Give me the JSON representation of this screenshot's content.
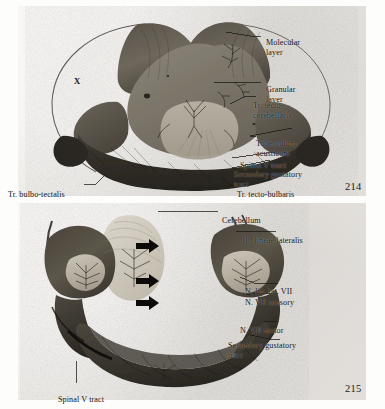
{
  "page": {
    "background_color": "#fdfdfc",
    "plate_background_color": "#eceae6",
    "ink_color": "#15130f"
  },
  "figures": [
    {
      "id": "figure-214",
      "page_number": "214",
      "description": "Transverse section through the cerebellum and auricular region",
      "interior_labels": [
        {
          "name": "region-marker-x",
          "text": "X",
          "x": 74,
          "y": 72
        }
      ],
      "callouts": [
        {
          "name": "callout-molecular-layer",
          "text": "Molecular\nlayer",
          "align": "left",
          "x": 266,
          "y": 29
        },
        {
          "name": "callout-granular-layer",
          "text": "Granular\nlayer",
          "align": "left",
          "x": 266,
          "y": 76
        },
        {
          "name": "callout-tr-tecto-cerebellaris",
          "text": "Tr. tecto-\ncerebellaris",
          "align": "left",
          "x": 253,
          "y": 92
        },
        {
          "name": "callout-tuberculum-acusticum",
          "text": "Tuberculum\nacusticum",
          "align": "left",
          "x": 256,
          "y": 130
        },
        {
          "name": "callout-spinal-v-tract",
          "text": "Spinal V tract",
          "align": "left",
          "x": 240,
          "y": 152
        },
        {
          "name": "callout-secondary-gustatory-tract",
          "text": "Secondary gustatory\ntract",
          "align": "left",
          "x": 234,
          "y": 161
        },
        {
          "name": "callout-tr-tecto-bulbaris",
          "text": "Tr. tecto-bulbaris",
          "align": "left",
          "x": 237,
          "y": 181
        },
        {
          "name": "callout-tr-bulbo-tectalis",
          "text": "Tr. bulbo-tectalis",
          "align": "left",
          "x": 8,
          "y": 181
        }
      ]
    },
    {
      "id": "figure-215",
      "page_number": "215",
      "description": "Dissection of the cerebellum, lateral line and facial nerve components",
      "interior_labels": [],
      "callouts": [
        {
          "name": "callout-cerebellum",
          "text": "Cerebellum",
          "align": "left",
          "x": 222,
          "y": 207
        },
        {
          "name": "callout-l-lineae-lateralis",
          "text": "L. lineae lateralis",
          "align": "left",
          "x": 245,
          "y": 229
        },
        {
          "name": "callout-n-lin-lat-vii",
          "text": "N. lin. lat. VII",
          "align": "left",
          "x": 245,
          "y": 274
        },
        {
          "name": "callout-n-vii-sensory",
          "text": "N. VII sensory",
          "align": "left",
          "x": 245,
          "y": 291
        },
        {
          "name": "callout-n-vii-motor",
          "text": "N. VII motor",
          "align": "left",
          "x": 240,
          "y": 320
        },
        {
          "name": "callout-secondary-gustatory-tract-2",
          "text": "Secondary  gustatory\ntract",
          "align": "left",
          "x": 228,
          "y": 333
        },
        {
          "name": "callout-spinal-v-tract-2",
          "text": "Spinal V tract",
          "align": "left",
          "x": 58,
          "y": 386
        }
      ],
      "arrow_markers": [
        {
          "name": "arrow-marker-1",
          "y": 246
        },
        {
          "name": "arrow-marker-2",
          "y": 281
        },
        {
          "name": "arrow-marker-3",
          "y": 303
        }
      ]
    }
  ]
}
